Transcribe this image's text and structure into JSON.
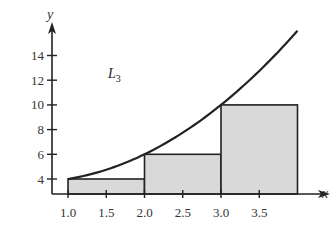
{
  "chart_data": {
    "type": "bar",
    "title": "",
    "xlabel": "x",
    "ylabel": "y",
    "annotation": {
      "text": "L",
      "subscript": "3",
      "x": 1.7,
      "y": 11.5
    },
    "xlim": [
      0.8,
      4.3
    ],
    "ylim": [
      2.8,
      16.5
    ],
    "x_ticks": [
      1.0,
      1.5,
      2.0,
      2.5,
      3.0,
      3.5
    ],
    "x_tick_labels": [
      "1.0",
      "1.5",
      "2.0",
      "2.5",
      "3.0",
      "3.5"
    ],
    "y_ticks": [
      4,
      6,
      8,
      10,
      12,
      14
    ],
    "y_tick_labels": [
      "4",
      "6",
      "8",
      "10",
      "12",
      "14"
    ],
    "grid": false,
    "series": [
      {
        "name": "left-endpoint rectangles (L3)",
        "kind": "bar",
        "bins": [
          [
            1.0,
            2.0
          ],
          [
            2.0,
            3.0
          ],
          [
            3.0,
            4.0
          ]
        ],
        "values": [
          4,
          6,
          10
        ],
        "fill": "#d9d9d9"
      },
      {
        "name": "curve y = x^2 - x + 4",
        "kind": "line",
        "x": [
          1.0,
          1.5,
          2.0,
          2.5,
          3.0,
          3.5,
          4.0
        ],
        "y": [
          4,
          4.75,
          6,
          7.75,
          10,
          12.75,
          16
        ]
      }
    ]
  }
}
